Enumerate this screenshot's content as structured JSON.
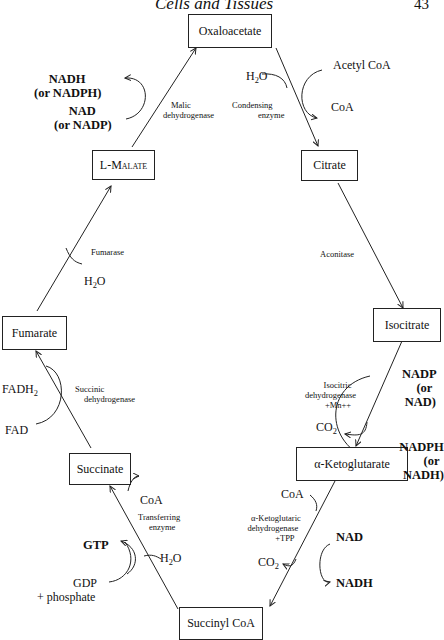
{
  "header": {
    "title": "Cells and Tissues",
    "page_number": "43"
  },
  "compounds": {
    "oxaloacetate": "Oxaloacetate",
    "citrate": "Citrate",
    "isocitrate": "Isocitrate",
    "ketoglutarate": "α-Ketoglutarate",
    "succinyl_coa": "Succinyl CoA",
    "succinate": "Succinate",
    "fumarate": "Fumarate",
    "malate": "L-Malate"
  },
  "enzymes": {
    "condensing": [
      "Condensing",
      "enzyme"
    ],
    "aconitase": "Aconitase",
    "isocitric": [
      "Isocitric",
      "dehydrogenase",
      "+Mn++"
    ],
    "ketoglutaric": [
      "α-Ketoglutaric",
      "dehydrogenase",
      "+TPP"
    ],
    "transferring": [
      "Transferring",
      "enzyme"
    ],
    "succinic": [
      "Succinic",
      "dehydrogenase"
    ],
    "fumarase": "Fumarase",
    "malic": [
      "Malic",
      "dehydrogenase"
    ]
  },
  "cofactors": {
    "acetyl_coa": "Acetyl CoA",
    "coa_out_citrate": "CoA",
    "h2o_condensing": "H2O",
    "nadp_in": [
      "NADP",
      "(or",
      "NAD)"
    ],
    "nadph_out": [
      "NADPH",
      "(or",
      "NADH)"
    ],
    "co2_isocitric": "CO2",
    "coa_in_keto": "CoA",
    "co2_keto": "CO2",
    "nad_in": "NAD",
    "nadh_out": "NADH",
    "h2o_transfer": "H2O",
    "coa_out_transfer": "CoA",
    "gdp_in": [
      "GDP",
      "+ phosphate"
    ],
    "gtp_out": "GTP",
    "fad_in": "FAD",
    "fadh2_out": "FADH2",
    "h2o_fumarase": "H2O",
    "nad_malic": [
      "NAD",
      "(or NADP)"
    ],
    "nadh_malic": [
      "NADH",
      "(or NADPH)"
    ]
  }
}
